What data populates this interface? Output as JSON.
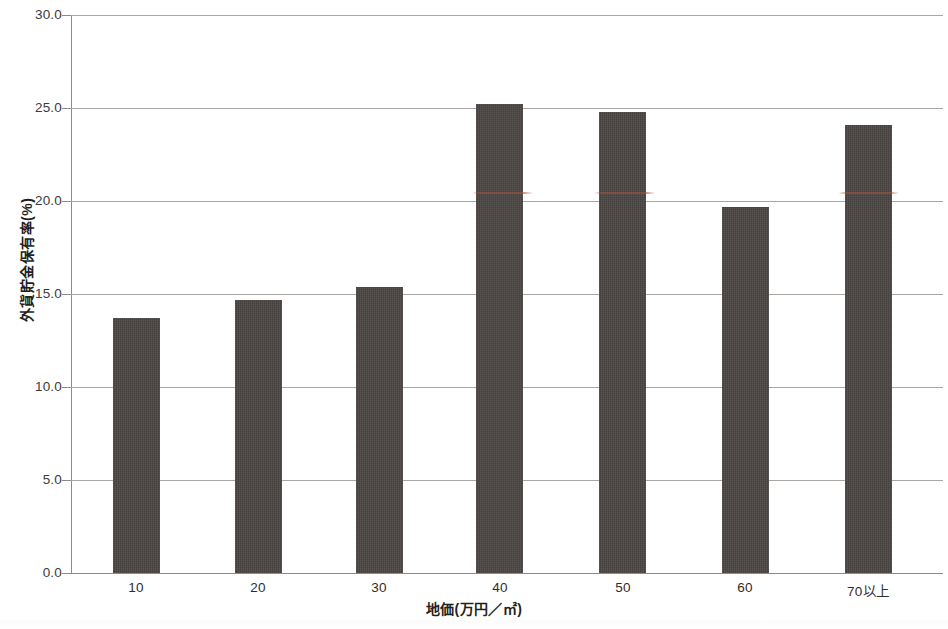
{
  "chart_data": {
    "type": "bar",
    "title": "",
    "subtitle": "",
    "xlabel": "地価(万円／㎡)",
    "ylabel": "外貨貯金保有率(%)",
    "categories": [
      "10",
      "20",
      "30",
      "40",
      "50",
      "60",
      "70以上"
    ],
    "values": [
      13.7,
      14.7,
      15.4,
      25.2,
      24.8,
      19.7,
      24.1
    ],
    "series": [
      {
        "name": "外貨貯金保有率",
        "values": [
          13.7,
          14.7,
          15.4,
          25.2,
          24.8,
          19.7,
          24.1
        ]
      }
    ],
    "ylim": [
      0.0,
      30.0
    ],
    "ytick_values": [
      0.0,
      5.0,
      10.0,
      15.0,
      20.0,
      25.0,
      30.0
    ],
    "ytick_labels": [
      "0.0",
      "5.0",
      "10.0",
      "15.0",
      "20.0",
      "25.0",
      "30.0"
    ],
    "grid": true,
    "grid_axis": "y",
    "legend": false,
    "legend_position": "none",
    "bar_color": "#4b4643",
    "gridline_color": "#aaa6a3",
    "axis_color": "#8d8a87",
    "text_color": "#231f1d",
    "background": "#ffffff",
    "annotations": []
  }
}
